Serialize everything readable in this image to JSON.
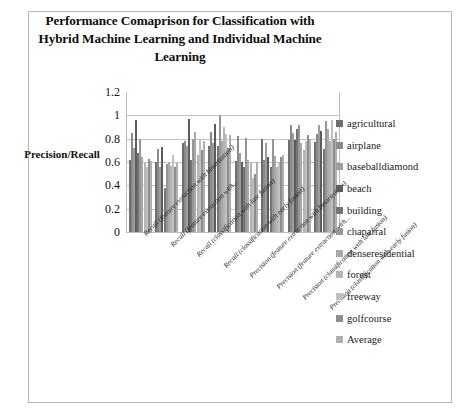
{
  "figure": {
    "border_color": "#b9b9b9",
    "background": "#ffffff"
  },
  "chart_data": {
    "type": "bar",
    "title": "Performance Comaprison for Classification with Hybrid Machine Learning and Individual Machine Learning",
    "xlabel": "",
    "ylabel": "Precision/Recall",
    "ylim": [
      0,
      1.2
    ],
    "yticks": [
      0,
      0.2,
      0.4,
      0.6,
      0.8,
      1,
      1.2
    ],
    "ytick_labels": [
      "0",
      "0.2",
      "0.4",
      "0.6",
      "0.8",
      "1",
      "1.2"
    ],
    "grid": true,
    "grid_axis": "y",
    "legend_position": "right",
    "categories": [
      "Recall (feature extraction with binarization)",
      "Recall (feature extraction with...",
      "Recall (classification with late fusion)",
      "Recall (classification with early fusion)",
      "Precision (feature extraction with binarization)",
      "Precision (feature extraction with...",
      "Precision (classification with late fusion)",
      "Precision (classification with early fusion)"
    ],
    "series": [
      {
        "name": "agricultural",
        "color": "#6f6f6f",
        "values": [
          0.62,
          0.6,
          0.76,
          0.74,
          0.61,
          0.8,
          0.79,
          0.77
        ]
      },
      {
        "name": "airplane",
        "color": "#8a8a8a",
        "values": [
          0.85,
          0.71,
          0.78,
          0.86,
          0.82,
          0.62,
          0.92,
          0.84
        ]
      },
      {
        "name": "baseballdiamond",
        "color": "#9d9d9d",
        "values": [
          0.72,
          0.56,
          0.74,
          0.76,
          0.68,
          0.76,
          0.85,
          0.92
        ]
      },
      {
        "name": "beach",
        "color": "#5c5c5c",
        "values": [
          0.96,
          0.73,
          0.97,
          0.93,
          0.6,
          0.64,
          0.79,
          0.87
        ]
      },
      {
        "name": "building",
        "color": "#747474",
        "values": [
          0.68,
          0.38,
          0.62,
          0.74,
          0.56,
          0.56,
          0.88,
          0.71
        ]
      },
      {
        "name": "chaparral",
        "color": "#969696",
        "values": [
          0.8,
          0.58,
          0.8,
          1.0,
          0.81,
          0.8,
          0.92,
          0.95
        ]
      },
      {
        "name": "denseresidential",
        "color": "#a8a8a8",
        "values": [
          0.64,
          0.6,
          0.86,
          0.78,
          0.62,
          0.65,
          0.76,
          0.88
        ]
      },
      {
        "name": "forest",
        "color": "#b4b4b4",
        "values": [
          0.6,
          0.57,
          0.66,
          0.9,
          0.6,
          0.56,
          0.7,
          0.78
        ]
      },
      {
        "name": "freeway",
        "color": "#c0c0c0",
        "values": [
          0.56,
          0.66,
          0.8,
          0.84,
          0.46,
          0.6,
          0.78,
          0.96
        ]
      },
      {
        "name": "golfcourse",
        "color": "#8e8e8e",
        "values": [
          0.63,
          0.56,
          0.7,
          0.72,
          0.5,
          0.64,
          0.83,
          0.8
        ]
      },
      {
        "name": "Average",
        "color": "#b0b0b0",
        "values": [
          0.61,
          0.59,
          0.78,
          0.83,
          0.6,
          0.66,
          0.8,
          0.86
        ]
      }
    ]
  }
}
